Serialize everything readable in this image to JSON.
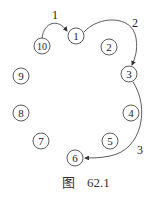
{
  "diagram": {
    "nodes": [
      {
        "label": "1",
        "x": 76,
        "y": 36
      },
      {
        "label": "2",
        "x": 109,
        "y": 47
      },
      {
        "label": "3",
        "x": 129,
        "y": 74
      },
      {
        "label": "4",
        "x": 131,
        "y": 113
      },
      {
        "label": "5",
        "x": 110,
        "y": 141
      },
      {
        "label": "6",
        "x": 75,
        "y": 158
      },
      {
        "label": "7",
        "x": 41,
        "y": 141
      },
      {
        "label": "8",
        "x": 21,
        "y": 113
      },
      {
        "label": "9",
        "x": 21,
        "y": 76
      },
      {
        "label": "10",
        "x": 42,
        "y": 46
      }
    ],
    "arrows": [
      {
        "label": "1",
        "from": "10",
        "to": "1",
        "label_x": 52,
        "label_y": 19
      },
      {
        "label": "2",
        "from": "1",
        "to": "3",
        "label_x": 132,
        "label_y": 27
      },
      {
        "label": "3",
        "from": "3",
        "to": "6",
        "label_x": 137,
        "label_y": 154
      }
    ],
    "stroke_color": "#333333"
  },
  "caption": {
    "prefix": "图",
    "number": "62.1"
  }
}
